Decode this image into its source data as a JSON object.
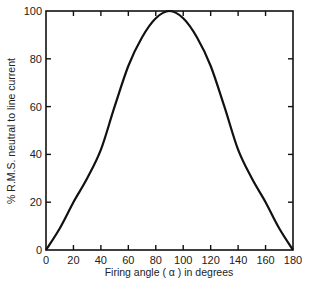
{
  "chart_data": {
    "type": "line",
    "title": "",
    "xlabel": "Firing angle ( α ) in degrees",
    "ylabel": "% R.M.S. neutral to line current",
    "xlim": [
      0,
      180
    ],
    "ylim": [
      0,
      100
    ],
    "x_ticks": [
      "0",
      "20",
      "40",
      "60",
      "80",
      "100",
      "120",
      "140",
      "160",
      "180"
    ],
    "y_ticks": [
      "0",
      "20",
      "40",
      "60",
      "80",
      "100"
    ],
    "grid": false,
    "legend": null,
    "series": [
      {
        "name": "neutral current",
        "x": [
          0,
          10,
          20,
          30,
          40,
          50,
          60,
          70,
          80,
          90,
          100,
          110,
          120,
          130,
          140,
          150,
          160,
          170,
          180
        ],
        "values": [
          0,
          9,
          20,
          30,
          42,
          60,
          77,
          89,
          97,
          100,
          97,
          89,
          77,
          60,
          42,
          30,
          20,
          9,
          0
        ]
      }
    ]
  }
}
